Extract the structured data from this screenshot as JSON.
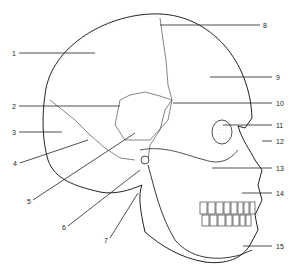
{
  "diagram": {
    "labels": [
      {
        "n": "1",
        "x": 12,
        "y": 55
      },
      {
        "n": "2",
        "x": 12,
        "y": 108
      },
      {
        "n": "3",
        "x": 12,
        "y": 133
      },
      {
        "n": "4",
        "x": 14,
        "y": 163
      },
      {
        "n": "5",
        "x": 28,
        "y": 202
      },
      {
        "n": "6",
        "x": 64,
        "y": 228
      },
      {
        "n": "7",
        "x": 105,
        "y": 241
      },
      {
        "n": "8",
        "x": 263,
        "y": 27
      },
      {
        "n": "9",
        "x": 276,
        "y": 79
      },
      {
        "n": "10",
        "x": 276,
        "y": 104
      },
      {
        "n": "11",
        "x": 276,
        "y": 127
      },
      {
        "n": "12",
        "x": 276,
        "y": 143
      },
      {
        "n": "13",
        "x": 276,
        "y": 170
      },
      {
        "n": "14",
        "x": 276,
        "y": 196
      },
      {
        "n": "15",
        "x": 276,
        "y": 247
      }
    ]
  }
}
